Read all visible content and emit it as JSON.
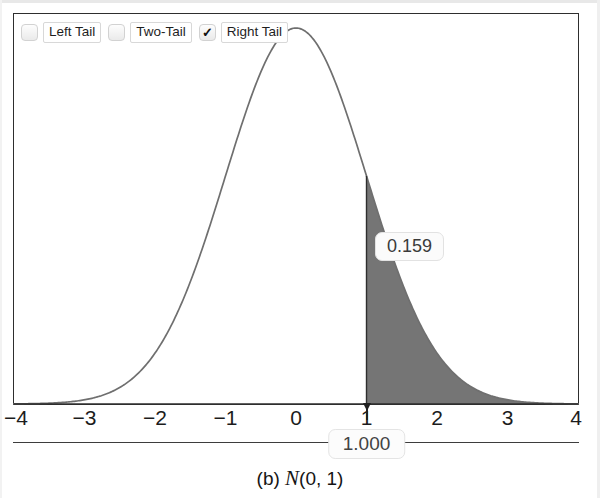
{
  "widget": {
    "toolbar": {
      "options": [
        {
          "name": "left-tail",
          "label": "Left Tail",
          "checked": false,
          "check_glyph": ""
        },
        {
          "name": "two-tail",
          "label": "Two-Tail",
          "checked": false,
          "check_glyph": ""
        },
        {
          "name": "right-tail",
          "label": "Right Tail",
          "checked": true,
          "check_glyph": "✓"
        }
      ]
    },
    "probability_label": "0.159",
    "x_value_field": "1.000",
    "caption_prefix": "(b) ",
    "caption_symbol": "N",
    "caption_params": "(0, 1)"
  },
  "colors": {
    "curve": "#6f6f6f",
    "shade_fill": "#757575",
    "frame": "#2e2e2e",
    "axis_text": "#1c1c1c",
    "callout_text": "#3a3a3a"
  },
  "chart_data": {
    "type": "area",
    "title": "",
    "subtitle": "",
    "xlabel": "",
    "ylabel": "",
    "distribution": "Normal",
    "mean": 0,
    "sd": 1,
    "xlim": [
      -4,
      4
    ],
    "ylim": [
      0,
      0.4
    ],
    "grid": false,
    "legend_position": "top-left",
    "xticks": [
      -4,
      -3,
      -2,
      -1,
      0,
      1,
      2,
      3,
      4
    ],
    "xtick_labels": [
      "−4",
      "−3",
      "−2",
      "−1",
      "0",
      "1",
      "2",
      "3",
      "4"
    ],
    "tail_mode": "Right Tail",
    "cutoff_x": 1.0,
    "tail_area": 0.159,
    "shaded_interval": [
      1.0,
      4.0
    ],
    "series": [
      {
        "name": "N(0, 1) density",
        "x": [
          -4,
          -3.5,
          -3,
          -2.5,
          -2,
          -1.5,
          -1,
          -0.5,
          0,
          0.5,
          1,
          1.5,
          2,
          2.5,
          3,
          3.5,
          4
        ],
        "y": [
          0.0001,
          0.0009,
          0.0044,
          0.0175,
          0.054,
          0.1295,
          0.242,
          0.3521,
          0.3989,
          0.3521,
          0.242,
          0.1295,
          0.054,
          0.0175,
          0.0044,
          0.0009,
          0.0001
        ]
      }
    ],
    "annotations": [
      {
        "name": "tail-probability",
        "text": "0.159",
        "x": 1.35,
        "y": 0.17
      },
      {
        "name": "cutoff-value",
        "text": "1.000",
        "x": 1.0,
        "y": -0.03
      }
    ]
  }
}
